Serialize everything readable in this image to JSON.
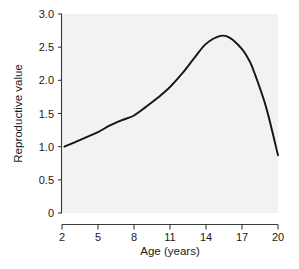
{
  "chart_data": {
    "type": "line",
    "title": "",
    "xlabel": "Age (years)",
    "ylabel": "Reproductive value",
    "xlim": [
      2,
      20
    ],
    "ylim": [
      0,
      3.0
    ],
    "grid": false,
    "legend": "none",
    "xticks": [
      "2",
      "5",
      "8",
      "11",
      "14",
      "17",
      "20"
    ],
    "xtick_values": [
      2,
      5,
      8,
      11,
      14,
      17,
      20
    ],
    "yticks": [
      "0",
      "0.5",
      "1.0",
      "1.5",
      "2.0",
      "2.5",
      "3.0"
    ],
    "ytick_values": [
      0,
      0.5,
      1.0,
      1.5,
      2.0,
      2.5,
      3.0
    ],
    "series": [
      {
        "name": "Reproductive value",
        "color": "#151515",
        "x": [
          2.2,
          3.0,
          4.0,
          5.0,
          6.0,
          7.0,
          8.0,
          9.0,
          10.0,
          11.0,
          12.0,
          13.0,
          14.0,
          15.2,
          16.0,
          17.0,
          17.6,
          18.0,
          19.0,
          20.0
        ],
        "values": [
          1.0,
          1.06,
          1.14,
          1.22,
          1.32,
          1.4,
          1.47,
          1.6,
          1.74,
          1.9,
          2.1,
          2.33,
          2.55,
          2.67,
          2.64,
          2.47,
          2.3,
          2.13,
          1.6,
          0.87
        ]
      }
    ]
  },
  "axis": {
    "x_title": "Age (years)",
    "y_title": "Reproductive value"
  },
  "colors": {
    "curve": "#151515",
    "axis": "#3a3a3a",
    "panel": "#f2f2f2",
    "text": "#1a1a1a"
  }
}
